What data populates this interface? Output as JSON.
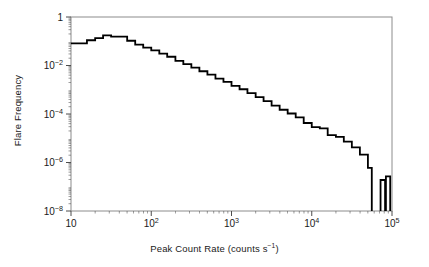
{
  "figure": {
    "ylabel": "Flare Frequency",
    "xlabel_prefix": "Peak Count Rate (counts s",
    "xlabel_exponent": "−1",
    "xlabel_suffix": ")",
    "xlabel_full": "Peak Count Rate (counts s−1)",
    "frame_color": "#8c8c8c",
    "curve_color": "#000000",
    "tick_color": "#4d4d4d",
    "background": "#ffffff"
  },
  "chart_data": {
    "type": "line",
    "subtype": "step-histogram",
    "title": "",
    "xlabel": "Peak Count Rate (counts s⁻¹)",
    "ylabel": "Flare Frequency",
    "xscale": "log",
    "yscale": "log",
    "xlim": [
      10,
      100000
    ],
    "ylim": [
      1e-08,
      1
    ],
    "grid": false,
    "legend": null,
    "xticks": [
      10,
      100,
      1000,
      10000,
      100000
    ],
    "xticklabels": [
      "10",
      "10²",
      "10³",
      "10⁴",
      "10⁵"
    ],
    "yticks": [
      1,
      0.01,
      0.0001,
      1e-06,
      1e-08
    ],
    "yticklabels": [
      "1",
      "10⁻²",
      "10⁻⁴",
      "10⁻⁶",
      "10⁻⁸"
    ],
    "bins_per_decade": 10,
    "x_edges": [
      10,
      12.6,
      15.8,
      20,
      25.1,
      31.6,
      39.8,
      50.1,
      63.1,
      79.4,
      100,
      126,
      158,
      200,
      251,
      316,
      398,
      501,
      631,
      794,
      1000,
      1260,
      1580,
      2000,
      2510,
      3160,
      3980,
      5010,
      6310,
      7940,
      10000,
      12600,
      15800,
      20000,
      25100,
      31600,
      39800,
      50100,
      56000
    ],
    "values": [
      0.082,
      0.082,
      0.11,
      0.135,
      0.175,
      0.155,
      0.155,
      0.105,
      0.072,
      0.055,
      0.042,
      0.031,
      0.023,
      0.0155,
      0.0115,
      0.0082,
      0.0058,
      0.0042,
      0.0029,
      0.0021,
      0.00145,
      0.00105,
      0.00072,
      0.0005,
      0.00034,
      0.00022,
      0.00015,
      0.000105,
      7.2e-05,
      4.25e-05,
      2.85e-05,
      2.55e-05,
      1.35e-05,
      1.15e-05,
      7.2e-06,
      4.2e-06,
      2.1e-06,
      6e-07
    ],
    "isolated_bins": [
      {
        "x_start": 72000,
        "x_end": 82000,
        "value": 1.9e-07
      },
      {
        "x_start": 84000,
        "x_end": 95000,
        "value": 2.7e-07
      }
    ],
    "annotations": []
  }
}
